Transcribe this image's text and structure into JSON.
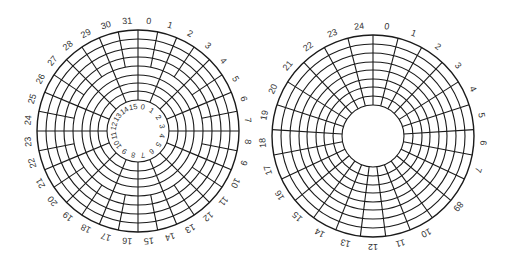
{
  "figure": {
    "stroke_color": "#1a1a1a",
    "label_color": "#333333"
  },
  "disks": [
    {
      "name": "zoned-disk",
      "center": [
        138,
        131
      ],
      "outer_radius": 101,
      "hole_radius": 31,
      "rings": [
        101,
        92,
        83,
        74,
        65,
        56,
        48,
        40,
        31
      ],
      "zones": [
        {
          "name": "outer-zone",
          "r_outer": 101,
          "r_inner": 65,
          "sectors": 32
        },
        {
          "name": "inner-zone",
          "r_outer": 65,
          "r_inner": 31,
          "sectors": 16
        }
      ],
      "outer_labels": [
        "0",
        "1",
        "2",
        "3",
        "4",
        "5",
        "6",
        "7",
        "8",
        "9",
        "10",
        "11",
        "12",
        "13",
        "14",
        "15",
        "16",
        "17",
        "18",
        "19",
        "20",
        "21",
        "22",
        "23",
        "24",
        "25",
        "26",
        "27",
        "28",
        "29",
        "30",
        "31"
      ],
      "outer_label_radius": 110,
      "inner_labels": [
        "0",
        "1",
        "2",
        "3",
        "4",
        "5",
        "6",
        "7",
        "8",
        "9",
        "10",
        "11",
        "12",
        "13",
        "14",
        "15"
      ],
      "inner_label_radius": 24
    },
    {
      "name": "constant-sector-disk",
      "center": [
        373,
        136
      ],
      "outer_radius": 101,
      "hole_radius": 31,
      "rings": [
        101,
        92,
        83,
        74,
        66,
        57,
        49,
        40,
        31
      ],
      "zones": [
        {
          "name": "single-zone",
          "r_outer": 101,
          "r_inner": 31,
          "sectors": 25
        }
      ],
      "outer_labels": [
        "0",
        "1",
        "2",
        "3",
        "4",
        "5",
        "6",
        "7",
        "89",
        "10",
        "11",
        "12",
        "13",
        "14",
        "15",
        "16",
        "17",
        "18",
        "19",
        "20",
        "21",
        "22",
        "23",
        "24"
      ],
      "label_slots": [
        0,
        1,
        2,
        3,
        4,
        5,
        6,
        7,
        8.5,
        10,
        11,
        12,
        13,
        14,
        15,
        16,
        17,
        18,
        19,
        20,
        21,
        22,
        23,
        24
      ],
      "outer_label_radius": 110
    }
  ]
}
